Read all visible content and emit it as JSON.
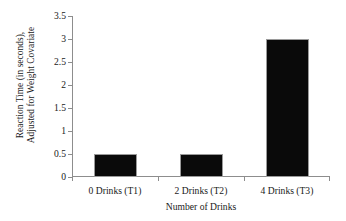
{
  "chart_data": {
    "type": "bar",
    "title": "",
    "categories": [
      "0 Drinks (T1)",
      "2 Drinks (T2)",
      "4 Drinks (T3)"
    ],
    "values": [
      0.5,
      0.5,
      3
    ],
    "xlabel": "Number of Drinks",
    "ylabel_lines": [
      "Reaction Time (in seconds),",
      "Adjusted for Weight Covariate"
    ],
    "ylabel": "Reaction Time (in seconds), Adjusted for Weight Covariate",
    "ylim": [
      0,
      3.5
    ],
    "yticks": [
      0,
      0.5,
      1,
      1.5,
      2,
      2.5,
      3,
      3.5
    ],
    "ytick_labels": [
      "0",
      "0.5",
      "1",
      "1.5",
      "2",
      "2.5",
      "3",
      "3.5"
    ],
    "grid": false,
    "legend": false,
    "bar_color": "#0a0a0a",
    "bar_edge_color": "#9a9a9a",
    "axis_color": "#8d8d8d",
    "background": "#ffffff"
  }
}
